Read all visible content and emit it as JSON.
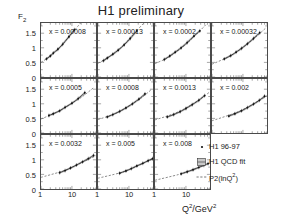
{
  "title": "H1 preliminary",
  "axes": {
    "ylabel": "F",
    "ylabel_sub": "2",
    "xlabel_base": "Q",
    "xlabel_sup1": "2",
    "xlabel_mid": "/GeV",
    "xlabel_sup2": "2",
    "yticks": [
      "0",
      "0.5",
      "1",
      "1.5"
    ],
    "xticks": [
      "1",
      "10"
    ]
  },
  "legend": {
    "items": [
      {
        "label": "H1 96-97",
        "marker": "point-marker"
      },
      {
        "label": "H1 QCD fit",
        "marker": "band-marker"
      },
      {
        "label_base": "P2(lnQ",
        "label_sup": "2",
        "label_tail": ")",
        "marker": "dashed-line-marker"
      }
    ]
  },
  "chart_data": {
    "type": "line",
    "title": "H1 preliminary",
    "xlabel": "Q^2/GeV^2",
    "ylabel": "F_2",
    "xscale": "log",
    "xlim": [
      1,
      60
    ],
    "ylim": [
      0,
      1.85
    ],
    "yticks": [
      0,
      0.5,
      1,
      1.5
    ],
    "xticks": [
      1,
      10
    ],
    "grid": false,
    "legend_position": "bottom-right",
    "panel_layout": {
      "rows": 3,
      "cols": 4,
      "legend_cell": "row3-col4"
    },
    "series_legend": [
      "H1 96-97",
      "H1 QCD fit",
      "P2(lnQ^2)"
    ],
    "panels": [
      {
        "label": "x = 0.00008",
        "x_value": 8e-05,
        "row": 1,
        "col": 1,
        "data_x": [
          1.5,
          2.0,
          2.5,
          3.5,
          5.0,
          8.0,
          12.0
        ],
        "data_y": [
          0.62,
          0.72,
          0.82,
          0.95,
          1.12,
          1.38,
          1.62
        ],
        "fit_x": [
          1.0,
          2.0,
          4.0,
          8.0,
          15.0,
          30.0
        ],
        "fit_y": [
          0.5,
          0.72,
          1.0,
          1.38,
          1.72,
          2.1
        ]
      },
      {
        "label": "x = 0.00013",
        "x_value": 0.00013,
        "row": 1,
        "col": 2,
        "data_x": [
          1.5,
          2.0,
          3.0,
          4.5,
          7.0,
          11.0,
          18.0
        ],
        "data_y": [
          0.56,
          0.65,
          0.78,
          0.92,
          1.1,
          1.32,
          1.58
        ],
        "fit_x": [
          1.0,
          2.0,
          4.0,
          8.0,
          15.0,
          35.0
        ],
        "fit_y": [
          0.47,
          0.65,
          0.88,
          1.18,
          1.5,
          1.92
        ]
      },
      {
        "label": "x = 0.0002",
        "x_value": 0.0002,
        "row": 1,
        "col": 3,
        "data_x": [
          2.0,
          3.0,
          4.5,
          7.0,
          11.0,
          18.0,
          28.0
        ],
        "data_y": [
          0.6,
          0.72,
          0.85,
          1.0,
          1.18,
          1.4,
          1.58
        ],
        "fit_x": [
          1.0,
          2.5,
          5.0,
          10.0,
          20.0,
          45.0
        ],
        "fit_y": [
          0.46,
          0.65,
          0.87,
          1.12,
          1.42,
          1.8
        ]
      },
      {
        "label": "x = 0.00032",
        "x_value": 0.00032,
        "row": 1,
        "col": 4,
        "data_x": [
          2.5,
          4.0,
          6.0,
          9.0,
          14.0,
          22.0,
          35.0
        ],
        "data_y": [
          0.62,
          0.73,
          0.85,
          0.98,
          1.14,
          1.32,
          1.52
        ],
        "fit_x": [
          1.0,
          3.0,
          6.0,
          12.0,
          25.0,
          55.0
        ],
        "fit_y": [
          0.44,
          0.66,
          0.85,
          1.08,
          1.35,
          1.68
        ]
      },
      {
        "label": "x = 0.0005",
        "x_value": 0.0005,
        "row": 2,
        "col": 1,
        "data_x": [
          1.8,
          2.5,
          4.0,
          6.0,
          10.0,
          16.0,
          26.0
        ],
        "data_y": [
          0.6,
          0.66,
          0.76,
          0.88,
          1.02,
          1.18,
          1.38
        ],
        "fit_x": [
          1.0,
          2.5,
          5.0,
          10.0,
          22.0,
          50.0
        ],
        "fit_y": [
          0.48,
          0.66,
          0.82,
          1.02,
          1.25,
          1.55
        ]
      },
      {
        "label": "x = 0.0008",
        "x_value": 0.0008,
        "row": 2,
        "col": 2,
        "data_x": [
          2.0,
          3.0,
          5.0,
          8.0,
          13.0,
          21.0,
          33.0
        ],
        "data_y": [
          0.55,
          0.63,
          0.74,
          0.86,
          1.0,
          1.16,
          1.34
        ],
        "fit_x": [
          1.0,
          3.0,
          6.0,
          12.0,
          25.0,
          55.0
        ],
        "fit_y": [
          0.46,
          0.63,
          0.78,
          0.98,
          1.2,
          1.5
        ]
      },
      {
        "label": "x = 0.0013",
        "x_value": 0.0013,
        "row": 2,
        "col": 3,
        "data_x": [
          2.5,
          4.0,
          6.5,
          10.0,
          16.0,
          26.0,
          40.0
        ],
        "data_y": [
          0.55,
          0.63,
          0.73,
          0.84,
          0.97,
          1.12,
          1.28
        ],
        "fit_x": [
          1.0,
          3.0,
          7.0,
          14.0,
          28.0,
          58.0
        ],
        "fit_y": [
          0.45,
          0.61,
          0.77,
          0.95,
          1.15,
          1.4
        ]
      },
      {
        "label": "x = 0.002",
        "x_value": 0.002,
        "row": 2,
        "col": 4,
        "data_x": [
          3.5,
          5.5,
          9.0,
          14.0,
          22.0,
          34.0,
          50.0
        ],
        "data_y": [
          0.58,
          0.66,
          0.76,
          0.87,
          0.99,
          1.12,
          1.26
        ],
        "fit_x": [
          1.0,
          4.0,
          9.0,
          18.0,
          35.0,
          60.0
        ],
        "fit_y": [
          0.42,
          0.63,
          0.78,
          0.95,
          1.12,
          1.28
        ]
      },
      {
        "label": "x = 0.0032",
        "x_value": 0.0032,
        "row": 3,
        "col": 1,
        "data_x": [
          4.0,
          6.0,
          9.0,
          14.0,
          22.0,
          34.0,
          50.0
        ],
        "data_y": [
          0.56,
          0.63,
          0.72,
          0.82,
          0.93,
          1.04,
          1.15
        ],
        "fit_x": [
          1.0,
          4.0,
          9.0,
          18.0,
          35.0,
          60.0
        ],
        "fit_y": [
          0.4,
          0.58,
          0.72,
          0.87,
          1.02,
          1.15
        ]
      },
      {
        "label": "x = 0.005",
        "x_value": 0.005,
        "row": 3,
        "col": 2,
        "data_x": [
          5.0,
          8.0,
          12.0,
          18.0,
          28.0,
          42.0,
          58.0
        ],
        "data_y": [
          0.54,
          0.62,
          0.7,
          0.79,
          0.88,
          0.97,
          1.04
        ],
        "fit_x": [
          1.0,
          5.0,
          11.0,
          22.0,
          40.0,
          62.0
        ],
        "fit_y": [
          0.37,
          0.55,
          0.68,
          0.82,
          0.95,
          1.04
        ]
      },
      {
        "label": "x = 0.008",
        "x_value": 0.008,
        "row": 3,
        "col": 3,
        "data_x": [
          7.0,
          11.0,
          17.0,
          26.0,
          38.0,
          52.0
        ],
        "data_y": [
          0.52,
          0.59,
          0.66,
          0.74,
          0.81,
          0.87
        ],
        "fit_x": [
          1.0,
          6.0,
          13.0,
          26.0,
          45.0,
          65.0
        ],
        "fit_y": [
          0.3,
          0.5,
          0.62,
          0.74,
          0.84,
          0.9
        ]
      }
    ]
  }
}
